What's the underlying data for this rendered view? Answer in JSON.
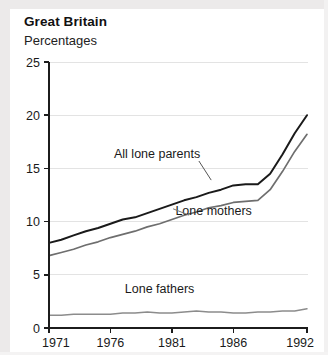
{
  "header": {
    "title": "Great Britain",
    "subtitle": "Percentages"
  },
  "chart_data": {
    "type": "line",
    "title": "Great Britain",
    "subtitle": "Percentages",
    "xlabel": "",
    "ylabel": "Percentages",
    "xlim": [
      1971,
      1992
    ],
    "ylim": [
      0,
      25
    ],
    "yticks": [
      0,
      5,
      10,
      15,
      20,
      25
    ],
    "ytick_labels": [
      "0",
      "5",
      "10",
      "15",
      "20",
      "25"
    ],
    "xticks": [
      1971,
      1976,
      1981,
      1986,
      1992
    ],
    "xtick_labels": [
      "1971",
      "1976",
      "1981",
      "1986",
      "1992"
    ],
    "grid": "horizontal",
    "legend_position": "inline-annotations",
    "x": [
      1971,
      1972,
      1973,
      1974,
      1975,
      1976,
      1977,
      1978,
      1979,
      1980,
      1981,
      1982,
      1983,
      1984,
      1985,
      1986,
      1987,
      1988,
      1989,
      1990,
      1991,
      1992
    ],
    "series": [
      {
        "name": "All lone parents",
        "color": "#1a1a1a",
        "values": [
          8.0,
          8.3,
          8.7,
          9.1,
          9.4,
          9.8,
          10.2,
          10.4,
          10.8,
          11.2,
          11.6,
          12.0,
          12.3,
          12.7,
          13.0,
          13.4,
          13.5,
          13.5,
          14.5,
          16.3,
          18.3,
          20.0
        ]
      },
      {
        "name": "Lone mothers",
        "color": "#6e6e6e",
        "values": [
          6.8,
          7.1,
          7.4,
          7.8,
          8.1,
          8.5,
          8.8,
          9.1,
          9.5,
          9.8,
          10.2,
          10.6,
          10.9,
          11.3,
          11.5,
          11.8,
          11.9,
          12.0,
          13.0,
          14.7,
          16.6,
          18.2
        ]
      },
      {
        "name": "Lone fathers",
        "color": "#8c8c8c",
        "values": [
          1.2,
          1.2,
          1.3,
          1.3,
          1.3,
          1.3,
          1.4,
          1.4,
          1.5,
          1.4,
          1.4,
          1.5,
          1.6,
          1.5,
          1.5,
          1.4,
          1.4,
          1.5,
          1.5,
          1.6,
          1.6,
          1.8
        ]
      }
    ],
    "annotations": [
      {
        "text": "All lone parents",
        "x": 1979.8,
        "y": 16.0
      },
      {
        "text": "Lone mothers",
        "x": 1984.4,
        "y": 10.6
      },
      {
        "text": "Lone fathers",
        "x": 1980.0,
        "y": 3.3
      }
    ]
  }
}
